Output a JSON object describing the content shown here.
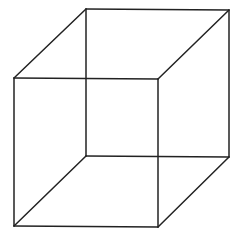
{
  "diagram": {
    "type": "wireframe-cube",
    "stroke_color": "#222222",
    "background": "#ffffff",
    "vertices": {
      "front_top_left": [
        14,
        78
      ],
      "front_top_right": [
        158,
        79
      ],
      "front_bottom_left": [
        14,
        226
      ],
      "front_bottom_right": [
        158,
        227
      ],
      "back_top_left": [
        86,
        9
      ],
      "back_top_right": [
        229,
        10
      ],
      "back_bottom_left": [
        86,
        156
      ],
      "back_bottom_right": [
        229,
        157
      ]
    },
    "edges": [
      {
        "name": "front-top-edge",
        "from": "front_top_left",
        "to": "front_top_right"
      },
      {
        "name": "front-bottom-edge",
        "from": "front_bottom_left",
        "to": "front_bottom_right"
      },
      {
        "name": "front-left-edge",
        "from": "front_top_left",
        "to": "front_bottom_left"
      },
      {
        "name": "front-right-edge",
        "from": "front_top_right",
        "to": "front_bottom_right"
      },
      {
        "name": "back-top-edge",
        "from": "back_top_left",
        "to": "back_top_right"
      },
      {
        "name": "back-bottom-edge",
        "from": "back_bottom_left",
        "to": "back_bottom_right"
      },
      {
        "name": "back-left-edge",
        "from": "back_top_left",
        "to": "back_bottom_left"
      },
      {
        "name": "back-right-edge",
        "from": "back_top_right",
        "to": "back_bottom_right"
      },
      {
        "name": "top-left-connector",
        "from": "front_top_left",
        "to": "back_top_left"
      },
      {
        "name": "top-right-connector",
        "from": "front_top_right",
        "to": "back_top_right"
      },
      {
        "name": "bottom-left-connector",
        "from": "front_bottom_left",
        "to": "back_bottom_left"
      },
      {
        "name": "bottom-right-connector",
        "from": "front_bottom_right",
        "to": "back_bottom_right"
      }
    ]
  }
}
